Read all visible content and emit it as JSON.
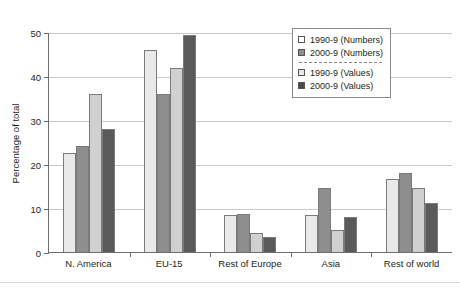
{
  "chart_data": {
    "type": "bar",
    "title": "",
    "subtitle": "",
    "xlabel": "",
    "ylabel": "Percentage of total",
    "ylim": [
      0,
      50
    ],
    "yticks": [
      0,
      10,
      20,
      30,
      40,
      50
    ],
    "grid": true,
    "legend_position": "top-right",
    "categories": [
      "N. America",
      "EU-15",
      "Rest of Europe",
      "Asia",
      "Rest of world"
    ],
    "series": [
      {
        "name": "1990-9 (Numbers)",
        "color": "#e9e9e9",
        "values": [
          22.5,
          45.8,
          8.3,
          8.3,
          16.5
        ]
      },
      {
        "name": "2000-9 (Numbers)",
        "color": "#8e8e8e",
        "values": [
          24.2,
          36.0,
          8.7,
          14.6,
          18.0
        ]
      },
      {
        "name": "1990-9 (Values)",
        "color": "#d0d0d0",
        "values": [
          36.0,
          41.8,
          4.4,
          5.0,
          14.6
        ]
      },
      {
        "name": "2000-9 (Values)",
        "color": "#5a5a5a",
        "values": [
          28.0,
          49.4,
          3.4,
          8.0,
          11.2
        ]
      }
    ]
  },
  "axis": {
    "y_title": "Percentage of total",
    "y_tick_labels": [
      "50",
      "40",
      "30",
      "20",
      "10",
      "0"
    ]
  },
  "legend": {
    "entries": [
      {
        "label": "1990-9 (Numbers)"
      },
      {
        "label": "2000-9 (Numbers)"
      },
      {
        "label": "1990-9 (Values)"
      },
      {
        "label": "2000-9 (Values)"
      }
    ]
  }
}
